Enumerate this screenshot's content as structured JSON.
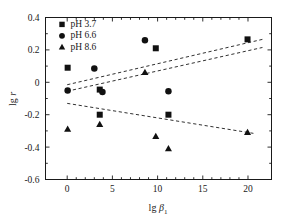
{
  "chart_data": {
    "type": "scatter",
    "title": "",
    "xlabel": "lg β₁",
    "ylabel": "lg r",
    "xlim": [
      -2.4,
      22.6
    ],
    "ylim": [
      -0.6,
      0.4
    ],
    "xticks": [
      "0",
      "5",
      "10",
      "15",
      "20"
    ],
    "xtick_values": [
      0,
      5,
      10,
      15,
      20
    ],
    "yticks": [
      "0.4",
      "0.2",
      "0",
      "-0.2",
      "-0.4",
      "-0.6"
    ],
    "ytick_values": [
      0.4,
      0.2,
      0,
      -0.2,
      -0.4,
      -0.6
    ],
    "grid": false,
    "legend_position": "upper-left-inside",
    "marker_color": "#111111",
    "axis_color": "#1a1a1a",
    "background_color": "#ffffff",
    "series": [
      {
        "name": "pH 3.7",
        "marker": "square",
        "points": [
          {
            "x": 0.05,
            "y": 0.09
          },
          {
            "x": 3.6,
            "y": -0.045
          },
          {
            "x": 3.6,
            "y": -0.2
          },
          {
            "x": 9.8,
            "y": 0.21
          },
          {
            "x": 11.2,
            "y": -0.2
          },
          {
            "x": 19.95,
            "y": 0.265
          }
        ],
        "trendline": {
          "x1": 0.0,
          "y1": -0.055,
          "x2": 21.6,
          "y2": 0.215
        }
      },
      {
        "name": "pH 6.6",
        "marker": "circle",
        "points": [
          {
            "x": 0.05,
            "y": -0.05
          },
          {
            "x": 3.0,
            "y": 0.085
          },
          {
            "x": 3.9,
            "y": -0.06
          },
          {
            "x": 8.6,
            "y": 0.26
          },
          {
            "x": 11.2,
            "y": -0.055
          }
        ],
        "trendline": {
          "x1": 0.0,
          "y1": -0.015,
          "x2": 21.6,
          "y2": 0.265
        }
      },
      {
        "name": "pH 8.6",
        "marker": "triangle",
        "points": [
          {
            "x": 0.05,
            "y": -0.29
          },
          {
            "x": 3.6,
            "y": -0.26
          },
          {
            "x": 8.6,
            "y": 0.06
          },
          {
            "x": 9.8,
            "y": -0.335
          },
          {
            "x": 11.2,
            "y": -0.41
          },
          {
            "x": 19.95,
            "y": -0.31
          }
        ],
        "trendline": {
          "x1": 0.0,
          "y1": -0.13,
          "x2": 20.6,
          "y2": -0.315
        }
      }
    ]
  },
  "legend": {
    "entries": [
      {
        "label": "pH 3.7",
        "marker": "square"
      },
      {
        "label": "pH 6.6",
        "marker": "circle"
      },
      {
        "label": "pH 8.6",
        "marker": "triangle"
      }
    ]
  },
  "axes": {
    "x_title_main": "lg",
    "x_title_symbol": "β",
    "x_title_sub": "1",
    "y_title_main": "lg",
    "y_title_symbol": "r"
  }
}
